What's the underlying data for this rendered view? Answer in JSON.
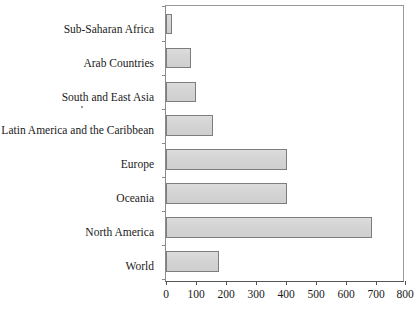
{
  "chart": {
    "background_color": "#ffffff",
    "bar_fill_color": "#d4d4d4",
    "bar_border_color": "#7d7d7d",
    "axis_color": "#555555",
    "text_color": "#1a1a1a"
  },
  "chart_data": {
    "type": "bar",
    "orientation": "horizontal",
    "title": "",
    "subtitle": "",
    "xlabel": "",
    "ylabel": "",
    "xlim": [
      0,
      800
    ],
    "xticks": [
      0,
      100,
      200,
      300,
      400,
      500,
      600,
      700,
      800
    ],
    "xtick_labels": [
      "0",
      "100",
      "200",
      "300",
      "400",
      "500",
      "600",
      "700",
      "800"
    ],
    "grid": false,
    "legend": null,
    "legend_position": "none",
    "categories": [
      "Sub-Saharan Africa",
      "Arab Countries",
      "South and East Asia",
      "Latin America and the Caribbean",
      "Europe",
      "Oceania",
      "North America",
      "World"
    ],
    "values": [
      20,
      83,
      100,
      157,
      410,
      410,
      695,
      180
    ],
    "series": [
      {
        "name": "",
        "values": [
          20,
          83,
          100,
          157,
          410,
          410,
          695,
          180
        ]
      }
    ]
  }
}
